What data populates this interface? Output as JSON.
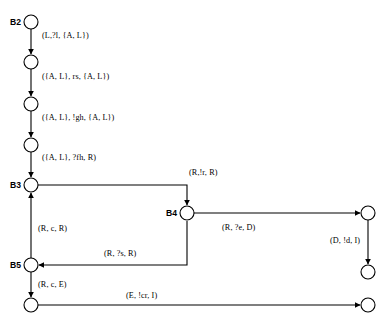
{
  "diagram": {
    "background_color": "#ffffff",
    "stroke_color": "#000000",
    "node_radius": 7,
    "nodes": [
      {
        "id": "B2",
        "label": "B2",
        "x": 31,
        "y": 22,
        "label_side": "left",
        "named": true
      },
      {
        "id": "n1",
        "label": "",
        "x": 31,
        "y": 62,
        "label_side": "left",
        "named": false
      },
      {
        "id": "n2",
        "label": "",
        "x": 31,
        "y": 104,
        "label_side": "left",
        "named": false
      },
      {
        "id": "n3",
        "label": "",
        "x": 31,
        "y": 145,
        "label_side": "left",
        "named": false
      },
      {
        "id": "B3",
        "label": "B3",
        "x": 31,
        "y": 185,
        "label_side": "left",
        "named": true
      },
      {
        "id": "B4",
        "label": "B4",
        "x": 187,
        "y": 213,
        "label_side": "left",
        "named": true
      },
      {
        "id": "n4",
        "label": "",
        "x": 368,
        "y": 213,
        "label_side": "left",
        "named": false
      },
      {
        "id": "B5",
        "label": "B5",
        "x": 31,
        "y": 265,
        "label_side": "left",
        "named": true
      },
      {
        "id": "n5",
        "label": "",
        "x": 368,
        "y": 272,
        "label_side": "left",
        "named": false
      },
      {
        "id": "n6",
        "label": "",
        "x": 31,
        "y": 305,
        "label_side": "left",
        "named": false
      },
      {
        "id": "n7",
        "label": "",
        "x": 368,
        "y": 305,
        "label_side": "left",
        "named": false
      }
    ],
    "edges": [
      {
        "id": "e1",
        "from": "B2",
        "to": "n1",
        "label": "(L,?l, {A, L})",
        "label_x": 42,
        "label_y": 36
      },
      {
        "id": "e2",
        "from": "n1",
        "to": "n2",
        "label": "({A, L}, rs, {A, L})",
        "label_x": 42,
        "label_y": 77
      },
      {
        "id": "e3",
        "from": "n2",
        "to": "n3",
        "label": "({A, L}, !gh, {A, L})",
        "label_x": 42,
        "label_y": 118
      },
      {
        "id": "e4",
        "from": "n3",
        "to": "B3",
        "label": "({A, L}, ?fh, R)",
        "label_x": 42,
        "label_y": 158
      },
      {
        "id": "e5",
        "from": "B3",
        "to": "B4",
        "label": "(R,!r, R)",
        "label_x": 189,
        "label_y": 173
      },
      {
        "id": "e6",
        "from": "B4",
        "to": "n4",
        "label": "(R, ?e, D)",
        "label_x": 222,
        "label_y": 228
      },
      {
        "id": "e7",
        "from": "n4",
        "to": "n5",
        "label": "(D, !d, I)",
        "label_x": 332,
        "label_y": 241
      },
      {
        "id": "e8",
        "from": "B4",
        "to": "B5",
        "label": "(R, ?s, R)",
        "label_x": 104,
        "label_y": 254
      },
      {
        "id": "e9",
        "from": "B5",
        "to": "B3",
        "label": "(R, c, R)",
        "label_x": 38,
        "label_y": 229
      },
      {
        "id": "e10",
        "from": "B5",
        "to": "n6",
        "label": "(R, c, E)",
        "label_x": 38,
        "label_y": 285
      },
      {
        "id": "e11",
        "from": "n6",
        "to": "n7",
        "label": "(E, !cr, I)",
        "label_x": 126,
        "label_y": 296
      }
    ]
  }
}
